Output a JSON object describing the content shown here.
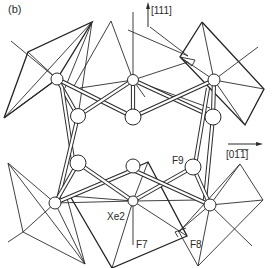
{
  "figure": {
    "panel_label": "(b)",
    "axes": {
      "vertical": {
        "label": "[111]",
        "direction": "up"
      },
      "horizontal": {
        "label": "[01̅1̅]",
        "label_plain": "[0-1-1]",
        "direction": "right"
      }
    },
    "atom_labels": {
      "xe2": "Xe2",
      "f7": "F7",
      "f8": "F8",
      "f9": "F9"
    }
  }
}
